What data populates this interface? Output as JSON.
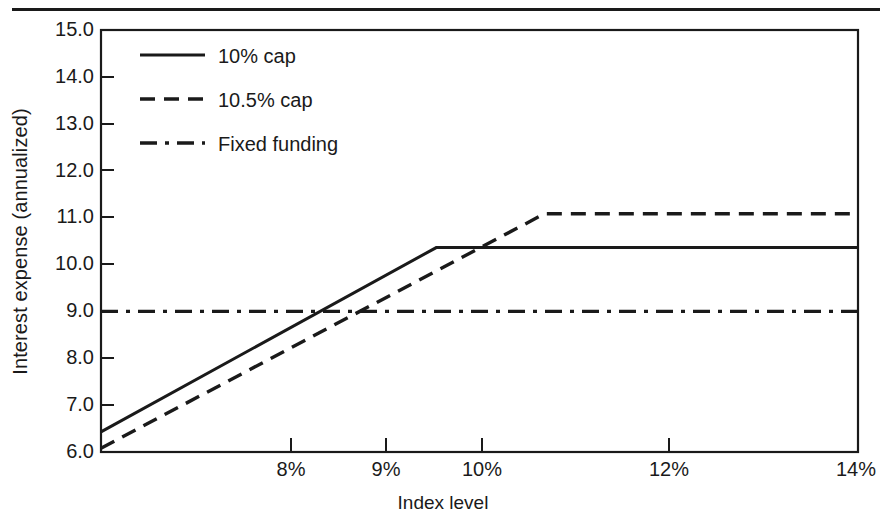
{
  "chart_data": {
    "type": "line",
    "title": "",
    "xlabel": "Index level",
    "ylabel": "Interest expense (annualized)",
    "xlim": [
      7,
      14
    ],
    "ylim": [
      6,
      15
    ],
    "grid": false,
    "legend_position": "upper-left-inside",
    "x_tick_labels": [
      "8%",
      "9%",
      "10%",
      "12%",
      "14%"
    ],
    "x_tick_values": [
      8,
      9,
      10,
      12,
      14
    ],
    "y_tick_labels": [
      "15.0",
      "14.0",
      "13.0",
      "12.0",
      "11.0",
      "10.0",
      "9.0",
      "8.0",
      "7.0",
      "6.0"
    ],
    "y_tick_values": [
      15.0,
      14.0,
      13.0,
      12.0,
      11.0,
      10.0,
      9.0,
      8.0,
      7.0,
      6.0
    ],
    "series": [
      {
        "name": "10% cap",
        "style": "solid",
        "color": "#1a1a1a",
        "x": [
          7.0,
          10.1,
          14.0
        ],
        "values": [
          6.43,
          10.36,
          10.36
        ]
      },
      {
        "name": "10.5% cap",
        "style": "dashed",
        "color": "#1a1a1a",
        "x": [
          7.0,
          11.1,
          14.0
        ],
        "values": [
          6.08,
          11.08,
          11.08
        ]
      },
      {
        "name": "Fixed funding",
        "style": "dashdot",
        "color": "#1a1a1a",
        "x": [
          7.0,
          14.0
        ],
        "values": [
          9.0,
          9.0
        ]
      }
    ]
  },
  "legend": {
    "items": [
      {
        "label": "10% cap",
        "style": "solid"
      },
      {
        "label": "10.5% cap",
        "style": "dashed"
      },
      {
        "label": "Fixed funding",
        "style": "dashdot"
      }
    ]
  },
  "axes": {
    "x_label": "Index level",
    "y_label": "Interest expense (annualized)",
    "x_ticks": [
      "8%",
      "9%",
      "10%",
      "12%",
      "14%"
    ],
    "y_ticks": [
      "15.0",
      "14.0",
      "13.0",
      "12.0",
      "11.0",
      "10.0",
      "9.0",
      "8.0",
      "7.0",
      "6.0"
    ]
  },
  "colors": {
    "ink": "#1a1a1a",
    "background": "#ffffff"
  }
}
